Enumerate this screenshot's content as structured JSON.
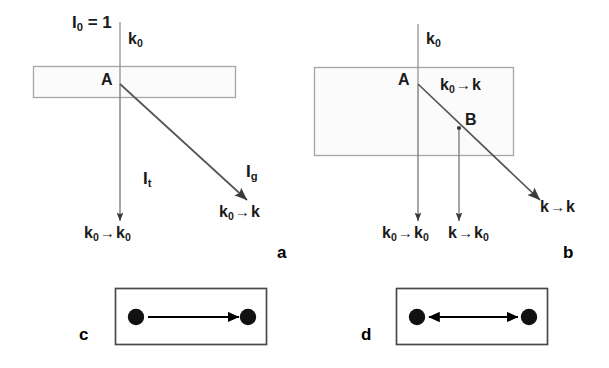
{
  "figure": {
    "type": "physics-scattering-diagram",
    "width": 609,
    "height": 368,
    "background": "#ffffff",
    "stroke_dark": "#3a3a3a",
    "stroke_box": "#9a9a9a",
    "stroke_black": "#000000"
  },
  "panel_a": {
    "label": "a",
    "incident_intensity": "I",
    "incident_intensity_sub": "0",
    "incident_intensity_eq": " = 1",
    "incident_wavevector": "k",
    "incident_wavevector_sub": "0",
    "point_a": "A",
    "transmitted_intensity": "I",
    "transmitted_intensity_sub": "t",
    "diffracted_intensity": "I",
    "diffracted_intensity_sub": "g",
    "transmitted_process": {
      "from": "k",
      "from_sub": "0",
      "arrow": "→",
      "to": "k",
      "to_sub": "0"
    },
    "diffracted_process": {
      "from": "k",
      "from_sub": "0",
      "arrow": "→",
      "to": "k",
      "to_sub": ""
    }
  },
  "panel_b": {
    "label": "b",
    "incident_wavevector": "k",
    "incident_wavevector_sub": "0",
    "point_a": "A",
    "point_b": "B",
    "inner_process": {
      "from": "k",
      "from_sub": "0",
      "arrow": "→",
      "to": "k",
      "to_sub": ""
    },
    "out_process_1": {
      "from": "k",
      "from_sub": "0",
      "arrow": "→",
      "to": "k",
      "to_sub": "0"
    },
    "out_process_2": {
      "from": "k",
      "from_sub": "",
      "arrow": "→",
      "to": "k",
      "to_sub": "0"
    },
    "out_process_3": {
      "from": "k",
      "from_sub": "",
      "arrow": "→",
      "to": "k",
      "to_sub": ""
    }
  },
  "panel_c": {
    "label": "c",
    "arrow_type": "single-headed-right",
    "node_count": 2
  },
  "panel_d": {
    "label": "d",
    "arrow_type": "double-headed",
    "node_count": 2
  }
}
